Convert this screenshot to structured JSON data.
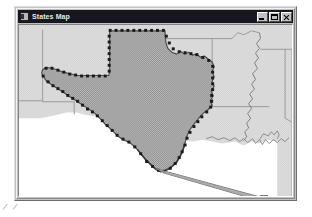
{
  "window": {
    "title": "States Map",
    "icon": "application-icon",
    "controls": [
      {
        "name": "minimize",
        "label": "Minimize",
        "glyph": "_"
      },
      {
        "name": "maximize",
        "label": "Maximize",
        "glyph": "□"
      },
      {
        "name": "close",
        "label": "Close",
        "glyph": "✕"
      }
    ]
  },
  "colors": {
    "title_bar": "#171720",
    "title_text": "#e8e8e8",
    "window_face": "#c0c0c0",
    "canvas": "#ffffff",
    "state_fill": "#dcdcdc",
    "state_stroke": "#8a8a8a",
    "selected_fill": "#9a9a9a",
    "selected_stroke": "#4d4d4d",
    "handle": "#1a1a1a",
    "rubberband": "#707070"
  },
  "map": {
    "name": "southern-united-states-map",
    "projection_note": "Texas selected in a states map view",
    "selected_feature": "Texas",
    "background_features": [
      "New Mexico",
      "Oklahoma",
      "Kansas",
      "Missouri",
      "Arkansas",
      "Louisiana",
      "Mississippi",
      "Alabama",
      "Tennessee",
      "Colorado"
    ],
    "selection": {
      "handle_count": 96,
      "handle_size_px": 3,
      "drag_handle": {
        "x": 248,
        "y": 181,
        "size_px": 5
      },
      "rubberband_from": {
        "x": 167,
        "y": 160
      },
      "rubberband_to": {
        "x": 248,
        "y": 181
      }
    }
  },
  "annotations": {
    "stray_marks": 2
  }
}
